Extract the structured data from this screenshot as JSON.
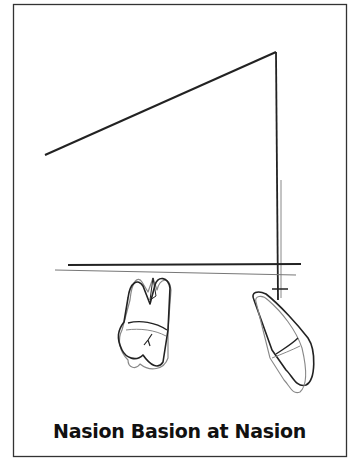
{
  "figure": {
    "caption": "Nasion Basion at Nasion",
    "stroke_color": "#222222",
    "faint_color": "#777777"
  }
}
